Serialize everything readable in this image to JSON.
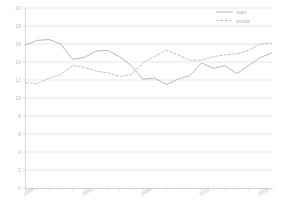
{
  "chart_data": {
    "type": "line",
    "title": "",
    "xlabel": "",
    "ylabel": "",
    "xlim": [
      1985,
      2006
    ],
    "ylim": [
      0,
      20
    ],
    "ytick_labels": [
      "0",
      "2",
      "4",
      "6",
      "8",
      "10",
      "12",
      "14",
      "16",
      "18",
      "20"
    ],
    "ytick_values": [
      0,
      2,
      4,
      6,
      8,
      10,
      12,
      14,
      16,
      18,
      20
    ],
    "xtick_labels": [
      "1985",
      "1990",
      "1995",
      "2000",
      "2005"
    ],
    "xtick_values": [
      1985,
      1990,
      1995,
      2000,
      2005
    ],
    "x_minor_ticks": [
      1985,
      1986,
      1987,
      1988,
      1989,
      1990,
      1991,
      1992,
      1993,
      1994,
      1995,
      1996,
      1997,
      1998,
      1999,
      2000,
      2001,
      2002,
      2003,
      2004,
      2005,
      2006
    ],
    "grid": true,
    "legend_position": "top-right",
    "x": [
      1985,
      1986,
      1987,
      1988,
      1989,
      1990,
      1991,
      1992,
      1993,
      1994,
      1995,
      1996,
      1997,
      1998,
      1999,
      2000,
      2001,
      2002,
      2003,
      2004,
      2005,
      2006
    ],
    "series": [
      {
        "name": "man",
        "style": "solid",
        "color": "#b4b8c2",
        "values": [
          15.9,
          16.4,
          16.5,
          16.0,
          14.3,
          14.5,
          15.2,
          15.3,
          14.6,
          13.6,
          12.1,
          12.2,
          11.5,
          12.1,
          12.5,
          13.9,
          13.3,
          13.6,
          12.7,
          13.6,
          14.5,
          15.0
        ]
      },
      {
        "name": "vrouw",
        "style": "dashed",
        "color": "#c0c4cc",
        "values": [
          11.7,
          11.6,
          12.2,
          12.6,
          13.6,
          13.4,
          13.0,
          12.8,
          12.4,
          12.6,
          13.9,
          14.6,
          15.3,
          14.8,
          14.2,
          14.2,
          14.6,
          14.8,
          14.9,
          15.3,
          16.0,
          16.1
        ]
      }
    ]
  },
  "legend": {
    "entries": [
      {
        "label": "man"
      },
      {
        "label": "vrouw"
      }
    ]
  }
}
